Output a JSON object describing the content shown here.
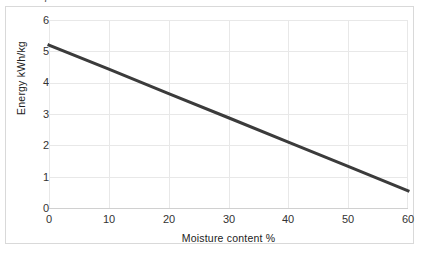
{
  "chart_data": {
    "type": "line",
    "title": "",
    "xlabel": "Moisture content %",
    "ylabel": "Energy kWh/kg",
    "xlim": [
      0,
      60
    ],
    "ylim": [
      0,
      6
    ],
    "x": [
      0,
      10,
      20,
      30,
      40,
      50,
      60
    ],
    "series": [
      {
        "name": "Energy",
        "values": [
          5.2,
          4.43,
          3.65,
          2.88,
          2.1,
          1.33,
          0.55
        ],
        "color": "#3b3b3b"
      }
    ],
    "xticks": [
      "0",
      "10",
      "20",
      "30",
      "40",
      "50",
      "60"
    ],
    "yticks": [
      "0",
      "1",
      "2",
      "3",
      "4",
      "5",
      "6"
    ],
    "ytick_cropped_top": "7",
    "grid": "horizontal-and-vertical",
    "legend": "none"
  },
  "axes": {
    "y_title": "Energy kWh/kg",
    "x_title": "Moisture content %"
  },
  "colors": {
    "line": "#3b3b3b",
    "grid": "#e8e8e8",
    "frame": "#d9d9d9",
    "background": "#ffffff",
    "text": "#333333"
  }
}
